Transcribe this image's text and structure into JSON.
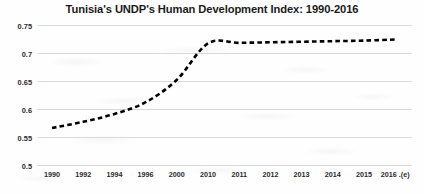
{
  "chart_data": {
    "type": "line",
    "title": "Tunisia's UNDP's Human Development Index: 1990-2016",
    "xlabel": "",
    "ylabel": "",
    "categories": [
      "1990",
      "1992",
      "1994",
      "1996",
      "2000",
      "2010",
      "2011",
      "2012",
      "2013",
      "2014",
      "2015",
      "2016 .(e)"
    ],
    "values": [
      0.567,
      0.578,
      0.592,
      0.613,
      0.653,
      0.718,
      0.719,
      0.72,
      0.721,
      0.722,
      0.723,
      0.725
    ],
    "series": [
      {
        "name": "Human Development Index",
        "values": [
          0.567,
          0.578,
          0.592,
          0.613,
          0.653,
          0.718,
          0.719,
          0.72,
          0.721,
          0.722,
          0.723,
          0.725
        ]
      }
    ],
    "ylim": [
      0.5,
      0.75
    ],
    "yticks": [
      0.75,
      0.7,
      0.65,
      0.6,
      0.55,
      0.5
    ],
    "ytick_labels": [
      "0.75",
      "0.7",
      "0.65",
      "0.6",
      "0.55",
      "0.5"
    ],
    "grid": true,
    "grid_axis": "y",
    "legend": false,
    "legend_position": "none",
    "line_style": "dashed",
    "line_color": "#000000",
    "line_width": 2.6,
    "markers": false,
    "annotations": []
  },
  "colors": {
    "background": "#fefefe",
    "grid": "#d4d4d4",
    "text": "#1b1b1b",
    "tick_text": "#2a2a2a",
    "line": "#000000"
  }
}
